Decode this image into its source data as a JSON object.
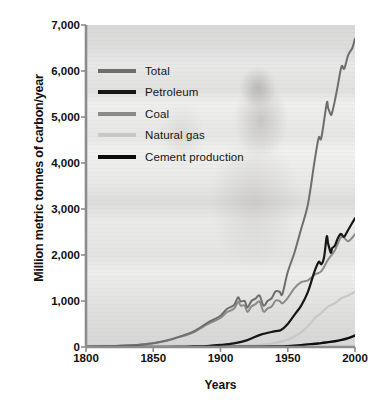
{
  "chart_data": {
    "type": "line",
    "title": "",
    "xlabel": "Years",
    "ylabel": "Million metric tonnes of carbon/year",
    "xlim": [
      1800,
      2000
    ],
    "ylim": [
      0,
      7000
    ],
    "xticks": [
      1800,
      1850,
      1900,
      1950,
      2000
    ],
    "xticklabels": [
      "1800",
      "1850",
      "1900",
      "1950",
      "2000"
    ],
    "yticks": [
      0,
      1000,
      2000,
      3000,
      4000,
      5000,
      6000,
      7000
    ],
    "yticklabels": [
      "0",
      "1,000",
      "2,000",
      "3,000",
      "4,000",
      "5,000",
      "6,000",
      "7,000"
    ],
    "grid": false,
    "legend_position": "upper-left",
    "series": [
      {
        "name": "Total",
        "color": "#6e6e6e",
        "width": 2.0,
        "x": [
          1800,
          1810,
          1820,
          1830,
          1840,
          1850,
          1860,
          1870,
          1880,
          1890,
          1895,
          1900,
          1905,
          1910,
          1913,
          1915,
          1918,
          1920,
          1923,
          1926,
          1929,
          1932,
          1935,
          1938,
          1941,
          1944,
          1946,
          1950,
          1955,
          1960,
          1965,
          1970,
          1973,
          1975,
          1979,
          1980,
          1982,
          1983,
          1985,
          1987,
          1990,
          1992,
          1995,
          1998,
          2000
        ],
        "y": [
          8,
          12,
          18,
          30,
          50,
          80,
          140,
          230,
          340,
          520,
          600,
          680,
          830,
          910,
          1080,
          990,
          1000,
          860,
          1000,
          1050,
          1120,
          900,
          1000,
          1060,
          1210,
          1200,
          1150,
          1630,
          2050,
          2570,
          3100,
          4050,
          4550,
          4550,
          5300,
          5200,
          5050,
          5100,
          5350,
          5650,
          6100,
          6050,
          6350,
          6500,
          6700
        ]
      },
      {
        "name": "Petroleum",
        "color": "#161616",
        "width": 2.2,
        "x": [
          1800,
          1850,
          1870,
          1880,
          1890,
          1900,
          1910,
          1920,
          1930,
          1940,
          1945,
          1950,
          1955,
          1960,
          1965,
          1970,
          1973,
          1975,
          1977,
          1979,
          1980,
          1982,
          1983,
          1985,
          1987,
          1989,
          1990,
          1992,
          1995,
          1998,
          2000
        ],
        "y": [
          0,
          0,
          5,
          12,
          22,
          45,
          80,
          150,
          270,
          340,
          370,
          500,
          700,
          900,
          1200,
          1650,
          1850,
          1800,
          1950,
          2400,
          2250,
          2050,
          2150,
          2200,
          2350,
          2450,
          2450,
          2400,
          2550,
          2700,
          2800
        ]
      },
      {
        "name": "Coal",
        "color": "#8a8a8a",
        "width": 2.0,
        "x": [
          1800,
          1810,
          1820,
          1830,
          1840,
          1850,
          1860,
          1870,
          1880,
          1890,
          1895,
          1900,
          1905,
          1910,
          1913,
          1915,
          1918,
          1920,
          1923,
          1926,
          1929,
          1932,
          1935,
          1938,
          1941,
          1944,
          1946,
          1950,
          1955,
          1960,
          1965,
          1970,
          1975,
          1980,
          1985,
          1990,
          1995,
          2000
        ],
        "y": [
          8,
          12,
          18,
          30,
          50,
          80,
          135,
          220,
          320,
          490,
          560,
          630,
          760,
          830,
          980,
          900,
          900,
          760,
          880,
          930,
          990,
          770,
          840,
          880,
          1010,
          1000,
          950,
          1070,
          1280,
          1410,
          1450,
          1570,
          1650,
          1900,
          2100,
          2400,
          2300,
          2450
        ]
      },
      {
        "name": "Natural gas",
        "color": "#c8c8c6",
        "width": 2.2,
        "x": [
          1800,
          1880,
          1900,
          1920,
          1930,
          1940,
          1950,
          1955,
          1960,
          1965,
          1970,
          1975,
          1980,
          1985,
          1990,
          1995,
          2000
        ],
        "y": [
          0,
          2,
          8,
          25,
          50,
          85,
          160,
          230,
          320,
          450,
          620,
          740,
          880,
          950,
          1060,
          1120,
          1200
        ]
      },
      {
        "name": "Cement production",
        "color": "#0d0d0d",
        "width": 2.4,
        "x": [
          1800,
          1900,
          1920,
          1940,
          1950,
          1960,
          1970,
          1975,
          1980,
          1985,
          1990,
          1995,
          2000
        ],
        "y": [
          0,
          2,
          6,
          12,
          20,
          40,
          70,
          85,
          105,
          125,
          155,
          195,
          250
        ]
      }
    ]
  },
  "legend": {
    "items": [
      {
        "label": "Total",
        "color": "#6e6e6e",
        "thickness": 4
      },
      {
        "label": "Petroleum",
        "color": "#161616",
        "thickness": 4
      },
      {
        "label": "Coal",
        "color": "#8a8a8a",
        "thickness": 4
      },
      {
        "label": "Natural gas",
        "color": "#c8c8c6",
        "thickness": 4
      },
      {
        "label": "Cement production",
        "color": "#0d0d0d",
        "thickness": 4
      }
    ]
  },
  "axes": {
    "y_title": "Million metric tonnes of carbon/year",
    "x_title": "Years"
  },
  "colors": {
    "axis": "#8c8c8c",
    "text": "#111111",
    "plot_background": "#e4e4e2"
  }
}
